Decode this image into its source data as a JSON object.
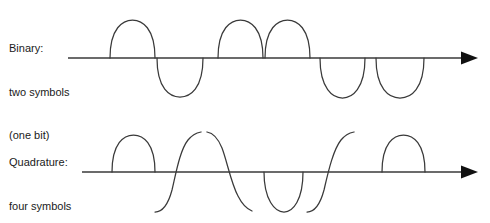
{
  "figure": {
    "background_color": "#ffffff",
    "stroke_color": "#3a3a3a",
    "text_color": "#1a1a1a",
    "width": 490,
    "height": 223
  },
  "rows": [
    {
      "id": "binary",
      "label_lines": [
        "Binary:",
        "two symbols",
        "(one bit)"
      ],
      "axis": {
        "y": 58,
        "x_start": 68,
        "x_end": 466,
        "arrow_tip_x": 478,
        "arrow_label": "time-axis-arrow"
      },
      "waveform": {
        "type": "half-cycle-lobes",
        "description": "Binary phase shift keying: each symbol is a full half-sine lobe either above (positive symbol) or below (negative symbol) the axis.",
        "amplitude": 36,
        "lobes": [
          {
            "x_start": 110,
            "x_end": 155,
            "polarity": "positive"
          },
          {
            "x_start": 157,
            "x_end": 203,
            "polarity": "negative"
          },
          {
            "x_start": 218,
            "x_end": 263,
            "polarity": "positive"
          },
          {
            "x_start": 265,
            "x_end": 310,
            "polarity": "positive"
          },
          {
            "x_start": 320,
            "x_end": 365,
            "polarity": "negative"
          },
          {
            "x_start": 376,
            "x_end": 424,
            "polarity": "negative"
          }
        ]
      }
    },
    {
      "id": "quadrature",
      "label_lines": [
        "Quadrature:",
        "four symbols",
        "(two bits)"
      ],
      "axis": {
        "y": 172,
        "x_start": 82,
        "x_end": 466,
        "arrow_tip_x": 478,
        "arrow_label": "time-axis-arrow"
      },
      "waveform": {
        "type": "phase-shifted-segments",
        "description": "Quadrature phase shift keying: four distinct carrier phases produce lobes and quarter-shifted rising/falling segments separated by phase discontinuities.",
        "amplitude": 36,
        "segments": [
          {
            "x_start": 110,
            "x_end": 155,
            "shape": "positive-lobe"
          },
          {
            "x_start": 155,
            "x_end": 200,
            "shape": "rising-through-axis"
          },
          {
            "x_start": 200,
            "x_end": 248,
            "shape": "falling-from-peak"
          },
          {
            "x_start": 248,
            "x_end": 295,
            "shape": "falling-trough"
          },
          {
            "x_start": 295,
            "x_end": 340,
            "shape": "rising-through-axis"
          },
          {
            "x_start": 345,
            "x_end": 392,
            "shape": "positive-lobe"
          }
        ]
      }
    }
  ]
}
